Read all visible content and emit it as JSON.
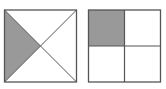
{
  "diagram": {
    "colors": {
      "stroke": "#555555",
      "shade": "#999999",
      "background": "#ffffff"
    },
    "figures": [
      {
        "name": "left-square",
        "divisions": "diagonals",
        "parts": 4,
        "shaded_parts": 1,
        "shaded_region": "left triangle"
      },
      {
        "name": "right-square",
        "divisions": "midlines",
        "parts": 4,
        "shaded_parts": 1,
        "shaded_region": "top-left quadrant"
      }
    ]
  }
}
